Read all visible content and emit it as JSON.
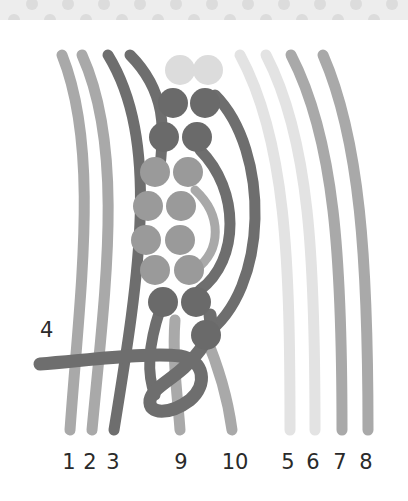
{
  "banner": {
    "pattern": "polka-dot",
    "bg": "#ededed",
    "dot": "#dcdcdc"
  },
  "step_number": "4",
  "colors": {
    "mid_gray": "#a9a9a9",
    "dark_gray": "#6e6e6e",
    "light_gray": "#e0e0e0",
    "bead_light": "#dcdcdc",
    "bead_dark": "#666666",
    "bead_mid": "#9a9a9a"
  },
  "strand_labels": [
    {
      "text": "1",
      "x": 69
    },
    {
      "text": "2",
      "x": 90
    },
    {
      "text": "3",
      "x": 113
    },
    {
      "text": "9",
      "x": 181
    },
    {
      "text": "10",
      "x": 235
    },
    {
      "text": "5",
      "x": 288
    },
    {
      "text": "6",
      "x": 313
    },
    {
      "text": "7",
      "x": 340
    },
    {
      "text": "8",
      "x": 366
    }
  ]
}
